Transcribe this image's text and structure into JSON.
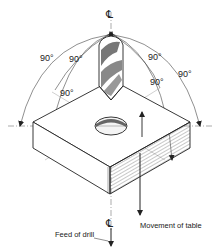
{
  "diagram": {
    "centerline_symbol_top": "℄",
    "centerline_symbol_bottom": "℄",
    "angles": [
      {
        "id": "outer-left",
        "label": "90°"
      },
      {
        "id": "mid-left",
        "label": "90°"
      },
      {
        "id": "inner-left",
        "label": "90°"
      },
      {
        "id": "inner-right",
        "label": "90°"
      },
      {
        "id": "mid-right",
        "label": "90°"
      },
      {
        "id": "outer-right",
        "label": "90°"
      }
    ],
    "captions": {
      "feed": "Feed of drill",
      "table": "Movement of table"
    },
    "colors": {
      "ink": "#222222",
      "background": "#ffffff"
    }
  }
}
